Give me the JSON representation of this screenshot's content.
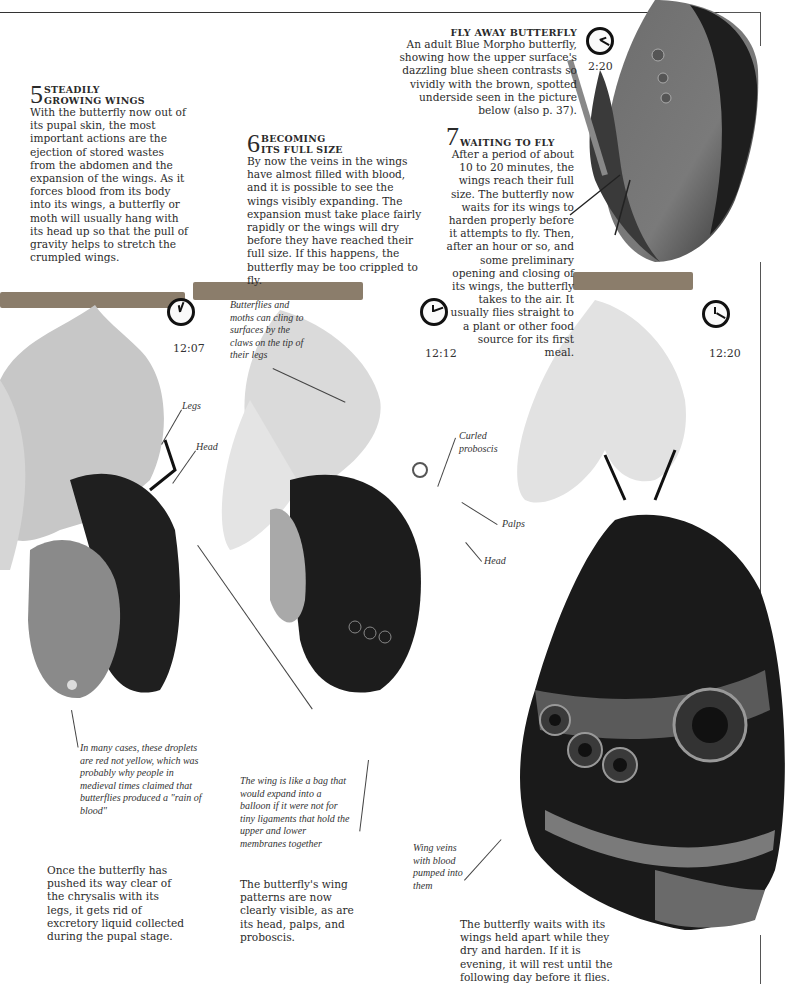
{
  "page": {
    "feature": {
      "title": "FLY AWAY BUTTERFLY",
      "text": "An adult Blue Morpho butterfly, showing how the upper surface's dazzling blue sheen contrasts so vividly with the brown, spotted underside seen in the picture below (also p. 37)."
    },
    "steps": [
      {
        "number": "5",
        "title_line1": "STEADILY",
        "title_line2": "GROWING WINGS",
        "text": "With the butterfly now out of its pupal skin, the most important actions are the ejection of stored wastes from the abdomen and the expansion of the wings. As it forces blood from its body into its wings, a butterfly or moth will usually hang with its head up so that the pull of gravity helps to stretch the crumpled wings.",
        "time": "12:07",
        "bottom_text": "Once the butterfly has pushed its way clear of the chrysalis with its legs, it gets rid of excretory liquid collected during the pupal stage."
      },
      {
        "number": "6",
        "title_line1": "BECOMING",
        "title_line2": "ITS FULL SIZE",
        "text": "By now the veins in the wings have almost filled with blood, and it is possible to see the wings visibly expanding. The expansion must take place fairly rapidly or the wings will dry before they have reached their full size. If this happens, the butterfly may be too crippled to fly.",
        "time": "12:12",
        "bottom_text": "The butterfly's wing patterns are now clearly visible, as are its head, palps, and proboscis."
      },
      {
        "number": "7",
        "title_line1": "WAITING TO FLY",
        "title_line2": "",
        "text": "After a period of about 10 to 20 minutes, the wings reach their full size. The butterfly now waits for its wings to harden properly before it attempts to fly. Then, after an hour or so, and some preliminary opening and closing of its wings, the butterfly takes to the air. It usually flies straight to a plant or other food source for its first meal.",
        "time": "12:20",
        "bottom_text": "The butterfly waits with its wings held apart while they dry and harden. If it is evening, it will rest until the following day before it flies."
      }
    ],
    "adult_time": "2:20",
    "labels": {
      "legs": "Legs",
      "head1": "Head",
      "claws": "Butterflies and moths can cling to surfaces by the claws on the tip of their legs",
      "curled_proboscis": "Curled proboscis",
      "palps": "Palps",
      "head2": "Head",
      "droplets": "In many cases, these droplets are red not yellow, which was probably why people in medieval times claimed that butterflies produced a \"rain of blood\"",
      "wing_bag": "The wing is like a bag that would expand into a balloon if it were not for tiny ligaments that hold the upper and lower membranes together",
      "wing_veins": "Wing veins with blood pumped into them"
    }
  }
}
